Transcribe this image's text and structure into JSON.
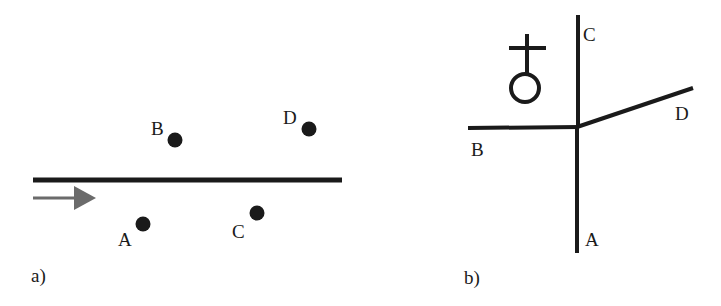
{
  "colors": {
    "background": "#ffffff",
    "line": "#1a1a1a",
    "arrow": "#6b6b6b",
    "text": "#1a1a1a"
  },
  "panel_a": {
    "caption": "a)",
    "baseline": {
      "x1": 33,
      "y1": 180,
      "x2": 342,
      "y2": 180
    },
    "flow_arrow": {
      "x1": 33,
      "x2": 96,
      "y": 198,
      "direction": "right"
    },
    "points": [
      {
        "label": "A",
        "cx": 143,
        "cy": 224,
        "label_x": 118,
        "label_y": 246
      },
      {
        "label": "B",
        "cx": 175,
        "cy": 140,
        "label_x": 151,
        "label_y": 135
      },
      {
        "label": "C",
        "cx": 257,
        "cy": 213,
        "label_x": 232,
        "label_y": 238
      },
      {
        "label": "D",
        "cx": 309,
        "cy": 129,
        "label_x": 283,
        "label_y": 124
      }
    ]
  },
  "panel_b": {
    "caption": "b)",
    "symbol": "female-cross-symbol",
    "center": {
      "x": 577,
      "y": 127
    },
    "branches": [
      {
        "label": "A",
        "x2": 577,
        "y2": 253,
        "label_x": 585,
        "label_y": 246
      },
      {
        "label": "B",
        "x2": 468,
        "y2": 128,
        "label_x": 471,
        "label_y": 156
      },
      {
        "label": "C",
        "x2": 577,
        "y2": 15,
        "label_x": 583,
        "label_y": 41
      },
      {
        "label": "D",
        "x2": 693,
        "y2": 87,
        "label_x": 675,
        "label_y": 120
      }
    ]
  }
}
